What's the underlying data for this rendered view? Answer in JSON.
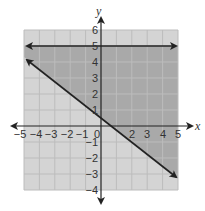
{
  "chart_data": {
    "type": "line",
    "title": "",
    "xlabel": "x",
    "ylabel": "y",
    "xlim": [
      -5,
      5
    ],
    "ylim": [
      -4,
      6
    ],
    "grid": true,
    "x_ticks": [
      "-5",
      "-4",
      "-3",
      "-2",
      "-1",
      "0",
      "1",
      "2",
      "3",
      "4",
      "5"
    ],
    "y_ticks": [
      "6",
      "5",
      "4",
      "3",
      "2",
      "1",
      "-1",
      "-2",
      "-3",
      "-4"
    ],
    "series": [
      {
        "name": "horizontal boundary",
        "equation": "y = 5",
        "points": [
          [
            -5,
            5
          ],
          [
            5,
            5
          ]
        ],
        "style": "solid",
        "arrows": "both"
      },
      {
        "name": "diagonal boundary",
        "equation": "y ≈ -0.76x + 0.6",
        "points": [
          [
            -5,
            4.3
          ],
          [
            5,
            -3.3
          ]
        ],
        "style": "solid",
        "arrows": "both"
      }
    ],
    "shaded_region": {
      "description": "solution region: below y = 5 and above the diagonal line",
      "color": "#a9a9a9"
    },
    "background_grid_color": "#d4d4d4"
  },
  "labels": {
    "x_axis": "x",
    "y_axis": "y",
    "x_ticks": [
      {
        "t": "−5",
        "x": 20
      },
      {
        "t": "−4",
        "x": 36
      },
      {
        "t": "−3",
        "x": 51
      },
      {
        "t": "−2",
        "x": 67
      },
      {
        "t": "−1",
        "x": 82
      },
      {
        "t": "0",
        "x": 97
      },
      {
        "t": "2",
        "x": 132
      },
      {
        "t": "3",
        "x": 147
      },
      {
        "t": "4",
        "x": 163
      },
      {
        "t": "5",
        "x": 178
      }
    ],
    "y_ticks": [
      {
        "t": "6",
        "y": 30
      },
      {
        "t": "5",
        "y": 46
      },
      {
        "t": "4",
        "y": 62
      },
      {
        "t": "3",
        "y": 78
      },
      {
        "t": "2",
        "y": 94
      },
      {
        "t": "1",
        "y": 110
      },
      {
        "t": "−1",
        "y": 142
      },
      {
        "t": "−2",
        "y": 158
      },
      {
        "t": "−3",
        "y": 174
      },
      {
        "t": "−4",
        "y": 190
      }
    ]
  }
}
